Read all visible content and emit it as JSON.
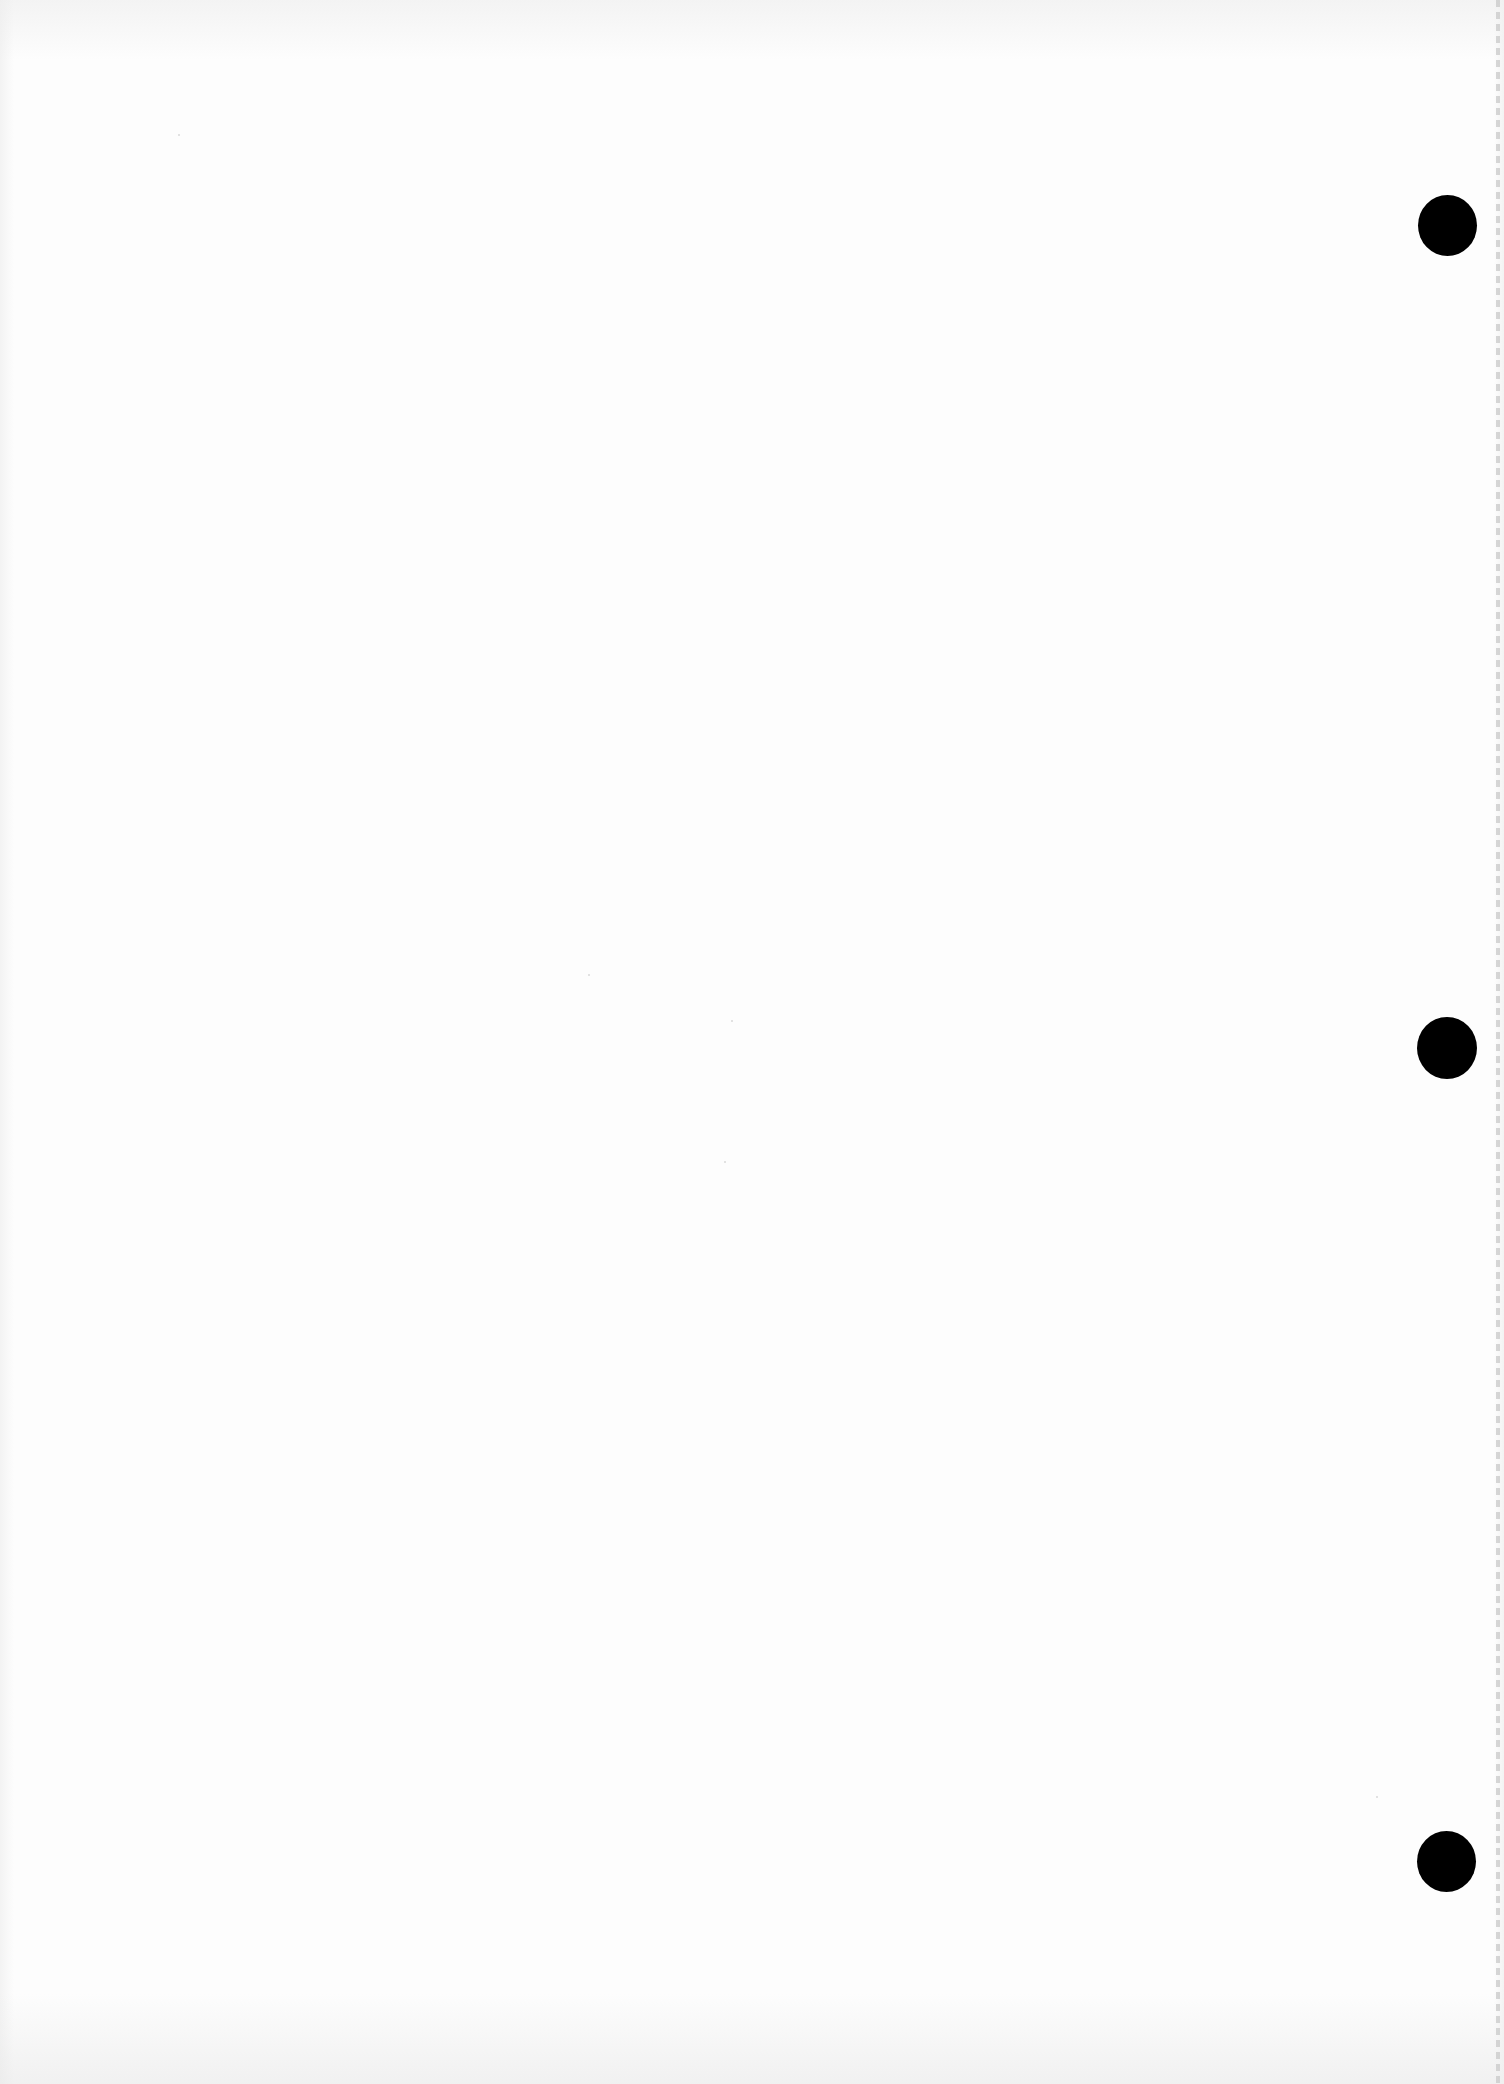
{
  "document": {
    "type": "blank scanned page",
    "text_content": [],
    "punch_holes": [
      {
        "position": "top",
        "color": "#000000"
      },
      {
        "position": "middle",
        "color": "#000000"
      },
      {
        "position": "bottom",
        "color": "#000000"
      }
    ],
    "colors": {
      "paper": "#fdfdfd",
      "hole": "#000000",
      "edge_perforation": "#c9c9c9"
    }
  }
}
